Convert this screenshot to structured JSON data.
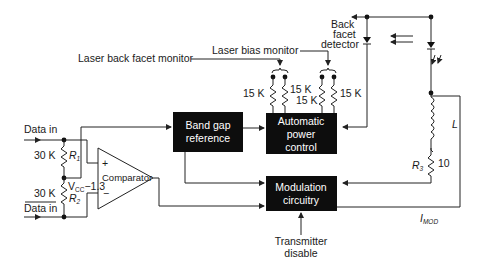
{
  "diagram": {
    "labels": {
      "laser_back_facet_monitor": "Laser back facet monitor",
      "laser_bias_monitor": "Laser bias monitor",
      "back_facet_detector_line1": "Back",
      "back_facet_detector_line2": "facet",
      "back_facet_detector_line3": "detector",
      "data_in_top": "Data in",
      "data_in_bottom": "Data in",
      "transmitter_disable_line1": "Transmitter",
      "transmitter_disable_line2": "disable",
      "vcc_label": "V",
      "vcc_sub": "CC",
      "vcc_suffix": "−1.3",
      "imod_label": "I",
      "imod_sub": "MOD",
      "inductor_label": "L"
    },
    "blocks": {
      "band_gap_line1": "Band gap",
      "band_gap_line2": "reference",
      "apc_line1": "Automatic",
      "apc_line2": "power",
      "apc_line3": "control",
      "mod_line1": "Modulation",
      "mod_line2": "circuitry",
      "comparator": "Comparator",
      "comparator_plus": "+",
      "comparator_minus": "−"
    },
    "resistors": {
      "r1_value": "30 K",
      "r1_name": "R",
      "r1_sub": "1",
      "r2_value": "30 K",
      "r2_name": "R",
      "r2_sub": "2",
      "r3_name": "R",
      "r3_sub": "3",
      "r3_value": "10",
      "bias_a": "15 K",
      "bias_b": "15 K",
      "bias_c": "15 K",
      "bias_d": "15 K"
    },
    "colors": {
      "block_fill": "#0d0d0d",
      "wire": "#222222",
      "background": "#ffffff"
    }
  }
}
